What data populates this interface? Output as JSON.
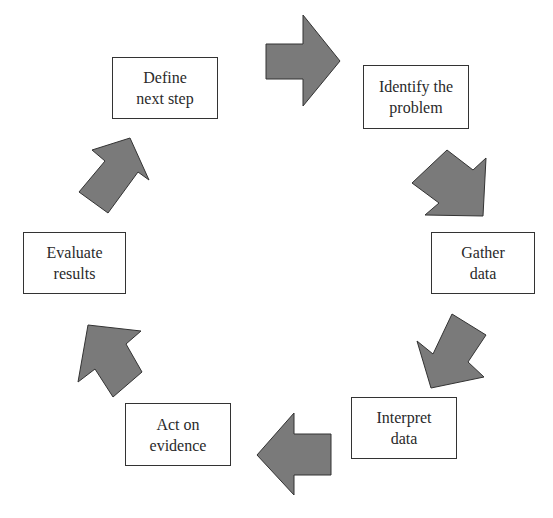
{
  "diagram": {
    "type": "cycle",
    "arrow_color": "#7a7a7a",
    "steps": [
      {
        "id": "identify",
        "lines": [
          "Identify the",
          "problem"
        ]
      },
      {
        "id": "gather",
        "lines": [
          "Gather",
          "data"
        ]
      },
      {
        "id": "interpret",
        "lines": [
          "Interpret",
          "data"
        ]
      },
      {
        "id": "act",
        "lines": [
          "Act on",
          "evidence"
        ]
      },
      {
        "id": "evaluate",
        "lines": [
          "Evaluate",
          "results"
        ]
      },
      {
        "id": "define",
        "lines": [
          "Define",
          "next step"
        ]
      }
    ]
  }
}
